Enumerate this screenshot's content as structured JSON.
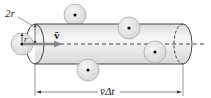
{
  "diagram": {
    "labels": {
      "diameter": "2r",
      "radius": "r",
      "velocity": "v̄",
      "length": "v̄Δt"
    },
    "colors": {
      "cylinder_fill": "#eeeeee",
      "cylinder_highlight": "#f8f8f8",
      "molecule_fill": "#e6e6e6",
      "molecule_stroke": "#aaaaaa",
      "velocity_arrow": "#888888",
      "outline": "#333333"
    },
    "molecules": [
      {
        "name": "moving-molecule",
        "cx": 22,
        "cy": 44
      },
      {
        "name": "molecule-top",
        "cx": 75,
        "cy": 15
      },
      {
        "name": "molecule-bottom-left",
        "cx": 88,
        "cy": 70
      },
      {
        "name": "molecule-top-right",
        "cx": 129,
        "cy": 28
      },
      {
        "name": "molecule-inside",
        "cx": 155,
        "cy": 52
      }
    ]
  }
}
